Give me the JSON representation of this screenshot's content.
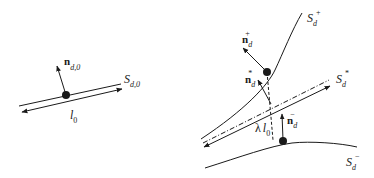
{
  "colors": {
    "ink": "#1a1a1a",
    "background": "#ffffff"
  },
  "left_panel": {
    "normal_label": {
      "main": "n",
      "sub": "d,0"
    },
    "segment_label": {
      "main": "S",
      "sub": "d,0"
    },
    "length_label": {
      "main": "l",
      "sub": "0"
    }
  },
  "right_panel": {
    "upper_surface": {
      "main": "S",
      "sub": "d",
      "sup": "+"
    },
    "upper_normal": {
      "main": "n",
      "sub": "d",
      "sup": "+"
    },
    "mid_normal": {
      "main": "n",
      "sub": "d",
      "sup": "*"
    },
    "mid_segment": {
      "main": "S",
      "sub": "d",
      "sup": "*"
    },
    "lower_normal": {
      "main": "n",
      "sub": "d",
      "sup": "−"
    },
    "length_label": {
      "prefix": "λ",
      "main": "l",
      "sub": "0"
    },
    "lower_surface": {
      "main": "S",
      "sub": "d",
      "sup": "−"
    }
  }
}
